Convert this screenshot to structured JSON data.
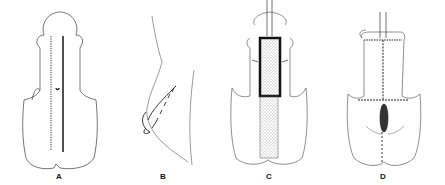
{
  "figure": {
    "panels": [
      {
        "id": "A",
        "label": "A",
        "description": "Initial outline with marked midline incision lines"
      },
      {
        "id": "B",
        "label": "B",
        "description": "Lateral view with sutures"
      },
      {
        "id": "C",
        "label": "C",
        "description": "Stippled graft placed along shaft with catheter"
      },
      {
        "id": "D",
        "label": "D",
        "description": "Final sutured closure with catheter"
      }
    ]
  },
  "colors": {
    "line": "#2a2a2a",
    "background": "#ffffff"
  }
}
